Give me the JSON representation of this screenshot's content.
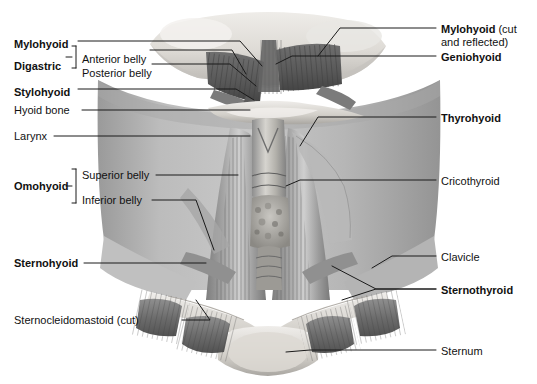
{
  "figure": {
    "style": "grayscale anatomical airbrush illustration",
    "background_color": "#ffffff",
    "leader_line_color": "#1a1a1a",
    "skin_tone": "#b9b9b9",
    "muscle_tone": "#8d8d8d",
    "bone_tone": "#e2e0dc"
  },
  "labels_left": [
    {
      "id": "mylohyoid",
      "text": "Mylohyoid",
      "bold": true,
      "x": 14,
      "y": 38
    },
    {
      "id": "digastric",
      "text": "Digastric",
      "bold": true,
      "x": 14,
      "y": 60
    },
    {
      "id": "anterior-belly",
      "text": "Anterior belly",
      "bold": false,
      "x": 82,
      "y": 53
    },
    {
      "id": "posterior-belly",
      "text": "Posterior belly",
      "bold": false,
      "x": 82,
      "y": 67
    },
    {
      "id": "stylohyoid",
      "text": "Stylohyoid",
      "bold": true,
      "x": 14,
      "y": 86
    },
    {
      "id": "hyoid-bone",
      "text": "Hyoid bone",
      "bold": false,
      "x": 14,
      "y": 107
    },
    {
      "id": "larynx",
      "text": "Larynx",
      "bold": false,
      "x": 14,
      "y": 133
    },
    {
      "id": "omohyoid",
      "text": "Omohyoid",
      "bold": true,
      "x": 14,
      "y": 184
    },
    {
      "id": "superior-belly",
      "text": "Superior belly",
      "bold": false,
      "x": 82,
      "y": 172
    },
    {
      "id": "inferior-belly",
      "text": "Inferior belly",
      "bold": false,
      "x": 82,
      "y": 197
    },
    {
      "id": "sternohyoid",
      "text": "Sternohyoid",
      "bold": true,
      "x": 14,
      "y": 260
    },
    {
      "id": "sternocleidomastoid",
      "text": "Sternocleidomastoid (cut)",
      "bold": false,
      "x": 14,
      "y": 317
    }
  ],
  "labels_right": [
    {
      "id": "mylohyoid-cut",
      "text": "Mylohyoid",
      "suffix": " (cut",
      "line2": "and reflected)",
      "bold": true,
      "x": 441,
      "y": 24
    },
    {
      "id": "geniohyoid",
      "text": "Geniohyoid",
      "suffix": "",
      "line2": "",
      "bold": true,
      "x": 441,
      "y": 52
    },
    {
      "id": "thyrohyoid",
      "text": "Thyrohyoid",
      "suffix": "",
      "line2": "",
      "bold": true,
      "x": 441,
      "y": 113
    },
    {
      "id": "cricothyroid",
      "text": "Cricothyroid",
      "suffix": "",
      "line2": "",
      "bold": false,
      "x": 441,
      "y": 176
    },
    {
      "id": "clavicle",
      "text": "Clavicle",
      "suffix": "",
      "line2": "",
      "bold": false,
      "x": 441,
      "y": 252
    },
    {
      "id": "sternothyroid",
      "text": "Sternothyroid",
      "suffix": "",
      "line2": "",
      "bold": true,
      "x": 441,
      "y": 285
    },
    {
      "id": "sternum",
      "text": "Sternum",
      "suffix": "",
      "line2": "",
      "bold": false,
      "x": 441,
      "y": 346
    }
  ],
  "structures": [
    "mandible",
    "mylohyoid muscle (cut and reflected)",
    "geniohyoid muscle",
    "anterior belly of digastric",
    "posterior belly of digastric",
    "stylohyoid muscle",
    "hyoid bone",
    "thyrohyoid muscle",
    "thyroid cartilage (larynx)",
    "cricothyroid muscle",
    "thyroid gland",
    "trachea",
    "superior belly of omohyoid",
    "inferior belly of omohyoid",
    "sternohyoid muscle",
    "sternothyroid muscle",
    "sternocleidomastoid (cut sternal and clavicular heads)",
    "clavicle",
    "sternum (manubrium)"
  ]
}
